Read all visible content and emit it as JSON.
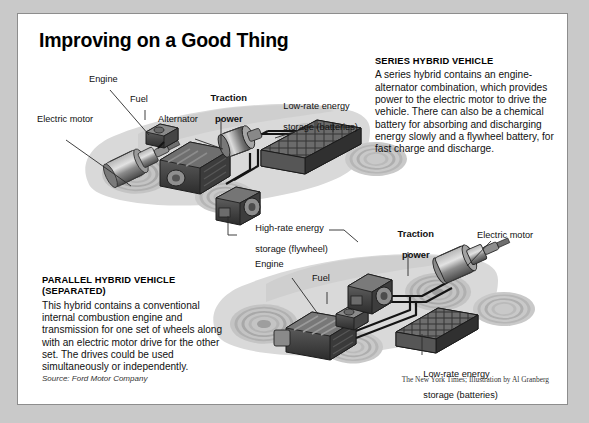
{
  "title": "Improving on a Good Thing",
  "series_block": {
    "heading": "SERIES HYBRID VEHICLE",
    "body": "A series hybrid contains an engine-alternator combination, which provides power to the electric motor to drive the vehicle. There can also be a chemical battery for absorbing and discharging energy slowly and a flywheel battery, for fast charge and discharge."
  },
  "parallel_block": {
    "heading_line1": "PARALLEL HYBRID VEHICLE",
    "heading_line2": "(SEPARATED)",
    "body": "This hybrid contains a conventional internal combustion engine and transmission for one set of wheels along with an electric motor drive for the other set. The drives could be used simultaneously or independently."
  },
  "labels": {
    "top_engine": "Engine",
    "top_fuel": "Fuel",
    "top_electric_motor": "Electric motor",
    "top_alternator": "Alternator",
    "top_traction_l1": "Traction",
    "top_traction_l2": "power",
    "top_battery_l1": "Low-rate energy",
    "top_battery_l2": "storage (batteries)",
    "flywheel_l1": "High-rate energy",
    "flywheel_l2": "storage (flywheel)",
    "bot_engine": "Engine",
    "bot_fuel": "Fuel",
    "bot_traction_l1": "Traction",
    "bot_traction_l2": "power",
    "bot_electric_motor": "Electric motor",
    "bot_battery_l1": "Low-rate energy",
    "bot_battery_l2": "storage (batteries)"
  },
  "footer": {
    "source": "Source: Ford Motor Company",
    "credit": "The New York Times; Illustration by Al Granberg"
  },
  "colors": {
    "page_background": "#c9c9c9",
    "card_background": "#ffffff",
    "card_border": "#8d8d8d",
    "text": "#111111",
    "vehicle_silhouette": "#d6d6d6",
    "wheel_ring": "#bdbdbd",
    "component_dark": "#3a3a3a",
    "component_mid": "#6e6e6e",
    "component_light": "#9a9a9a",
    "cable": "#1a1a1a"
  }
}
